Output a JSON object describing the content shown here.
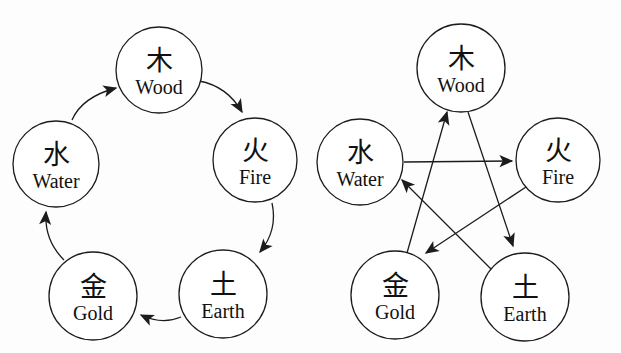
{
  "colors": {
    "ink": "#1c1c1c",
    "background": "#fdfdfd",
    "node_fill": "#ffffff"
  },
  "elements": {
    "wood": {
      "zh": "木",
      "en": "Wood"
    },
    "fire": {
      "zh": "火",
      "en": "Fire"
    },
    "earth": {
      "zh": "土",
      "en": "Earth"
    },
    "gold": {
      "zh": "金",
      "en": "Gold"
    },
    "water": {
      "zh": "水",
      "en": "Water"
    }
  },
  "left_diagram": {
    "arrow_style": "curved",
    "arrows": [
      {
        "from": "wood",
        "to": "fire"
      },
      {
        "from": "fire",
        "to": "earth"
      },
      {
        "from": "earth",
        "to": "gold"
      },
      {
        "from": "gold",
        "to": "water"
      },
      {
        "from": "water",
        "to": "wood"
      }
    ]
  },
  "right_diagram": {
    "arrow_style": "straight",
    "arrows": [
      {
        "from": "water",
        "to": "fire"
      },
      {
        "from": "wood",
        "to": "earth"
      },
      {
        "from": "fire",
        "to": "gold"
      },
      {
        "from": "gold",
        "to": "wood"
      },
      {
        "from": "earth",
        "to": "water"
      }
    ]
  }
}
